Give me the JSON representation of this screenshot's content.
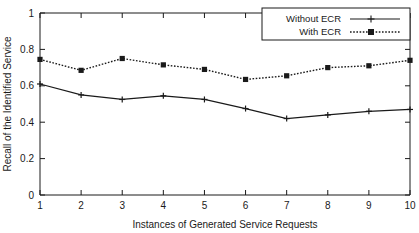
{
  "chart_data": {
    "type": "line",
    "title": "",
    "xlabel": "Instances of Generated Service Requests",
    "ylabel": "Recall of the Identified Service",
    "x": [
      1,
      2,
      3,
      4,
      5,
      6,
      7,
      8,
      9,
      10
    ],
    "xlim": [
      1,
      10
    ],
    "ylim": [
      0,
      1
    ],
    "xticks": [
      "1",
      "2",
      "3",
      "4",
      "5",
      "6",
      "7",
      "8",
      "9",
      "10"
    ],
    "yticks": [
      "0",
      "0.2",
      "0.4",
      "0.6",
      "0.8",
      "1"
    ],
    "grid": false,
    "legend_position": "top-right",
    "series": [
      {
        "name": "Without ECR",
        "style": "solid",
        "marker": "plus",
        "color": "#1a1a1a",
        "values": [
          0.61,
          0.55,
          0.525,
          0.545,
          0.525,
          0.475,
          0.42,
          0.44,
          0.46,
          0.47
        ]
      },
      {
        "name": "With ECR",
        "style": "dotted",
        "marker": "plus",
        "color": "#1a1a1a",
        "values": [
          0.745,
          0.685,
          0.75,
          0.715,
          0.69,
          0.635,
          0.655,
          0.7,
          0.71,
          0.74
        ]
      }
    ]
  },
  "legend": {
    "entries": [
      {
        "label": "Without ECR"
      },
      {
        "label": "With ECR"
      }
    ]
  },
  "colors": {
    "ink": "#1a1a1a",
    "background": "#ffffff"
  }
}
